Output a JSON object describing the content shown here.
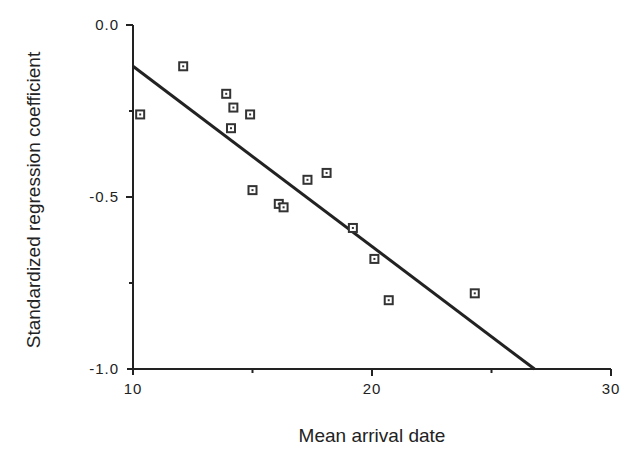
{
  "chart_data": {
    "type": "scatter",
    "title": "",
    "xlabel": "Mean arrival date",
    "ylabel": "Standardized regression coefficient",
    "xlim": [
      10,
      30
    ],
    "ylim": [
      -1.0,
      0.0
    ],
    "x_ticks": [
      {
        "value": 10,
        "label": "10"
      },
      {
        "value": 20,
        "label": "20"
      },
      {
        "value": 30,
        "label": "30"
      }
    ],
    "x_minor_ticks": [
      15,
      25
    ],
    "y_ticks": [
      {
        "value": 0.0,
        "label": "0.0"
      },
      {
        "value": -0.5,
        "label": "-0.5"
      },
      {
        "value": -1.0,
        "label": "-1.0"
      }
    ],
    "y_minor_ticks": [
      -0.25,
      -0.75
    ],
    "grid": false,
    "legend": null,
    "series": [
      {
        "name": "species",
        "marker": "square",
        "points": [
          {
            "x": 10.3,
            "y": -0.26
          },
          {
            "x": 12.1,
            "y": -0.12
          },
          {
            "x": 13.9,
            "y": -0.2
          },
          {
            "x": 14.2,
            "y": -0.24
          },
          {
            "x": 14.1,
            "y": -0.3
          },
          {
            "x": 14.9,
            "y": -0.26
          },
          {
            "x": 15.0,
            "y": -0.48
          },
          {
            "x": 16.1,
            "y": -0.52
          },
          {
            "x": 16.3,
            "y": -0.53
          },
          {
            "x": 17.3,
            "y": -0.45
          },
          {
            "x": 18.1,
            "y": -0.43
          },
          {
            "x": 19.2,
            "y": -0.59
          },
          {
            "x": 20.1,
            "y": -0.68
          },
          {
            "x": 20.7,
            "y": -0.8
          },
          {
            "x": 24.3,
            "y": -0.78
          }
        ]
      }
    ],
    "regression_line": {
      "x1": 10,
      "y1": -0.12,
      "x2": 26.8,
      "y2": -1.0
    }
  },
  "colors": {
    "ink": "#222222",
    "background": "#ffffff"
  }
}
